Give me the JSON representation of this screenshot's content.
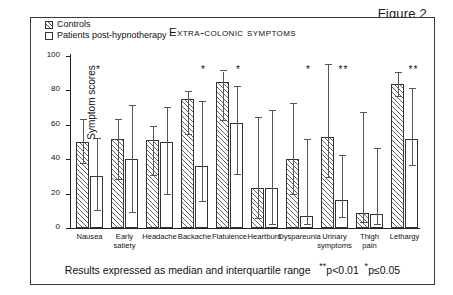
{
  "figure": {
    "label": "Figure 2"
  },
  "chart_title": "Extra-colonic symptoms",
  "ylabel": "Symptom scores",
  "caption": {
    "text": "Results expressed as median and interquartile range",
    "note_double": "p<0.01",
    "note_single": "p≤0.05",
    "star_double": "**",
    "star_single": "*"
  },
  "legend": {
    "items": [
      {
        "label": "Controls",
        "style": "hatched"
      },
      {
        "label": "Patients post-hypnotherapy",
        "style": "open"
      }
    ]
  },
  "chart_data": {
    "type": "bar",
    "title": "Extra-colonic symptoms",
    "xlabel": "",
    "ylabel": "Symptom scores",
    "ylim": [
      0,
      100
    ],
    "yticks": [
      0,
      20,
      40,
      60,
      80,
      100
    ],
    "grid": false,
    "legend_position": "top-left",
    "error_bars": "interquartile range",
    "categories": [
      "Nausea",
      "Early satiety",
      "Headache",
      "Backache",
      "Flatulence",
      "Heartburn",
      "Dyspareunia",
      "Urinary symptoms",
      "Thigh pain",
      "Lethargy"
    ],
    "significance": [
      "*",
      "",
      "",
      "*",
      "*",
      "",
      "*",
      "**",
      "",
      "**"
    ],
    "series": [
      {
        "name": "Controls",
        "values": [
          50,
          52,
          51,
          75,
          85,
          23,
          40,
          53,
          9,
          84
        ],
        "lower": [
          37,
          28,
          30,
          54,
          62,
          5,
          19,
          29,
          3,
          76
        ],
        "upper": [
          63,
          63,
          59,
          79,
          91,
          64,
          72,
          95,
          67,
          90
        ]
      },
      {
        "name": "Patients post-hypnotherapy",
        "values": [
          30,
          40,
          50,
          36,
          61,
          23,
          7,
          16,
          8,
          52
        ],
        "lower": [
          10,
          9,
          19,
          15,
          31,
          2,
          2,
          6,
          2,
          36
        ],
        "upper": [
          52,
          71,
          70,
          73,
          82,
          68,
          51,
          42,
          46,
          81
        ]
      }
    ]
  }
}
